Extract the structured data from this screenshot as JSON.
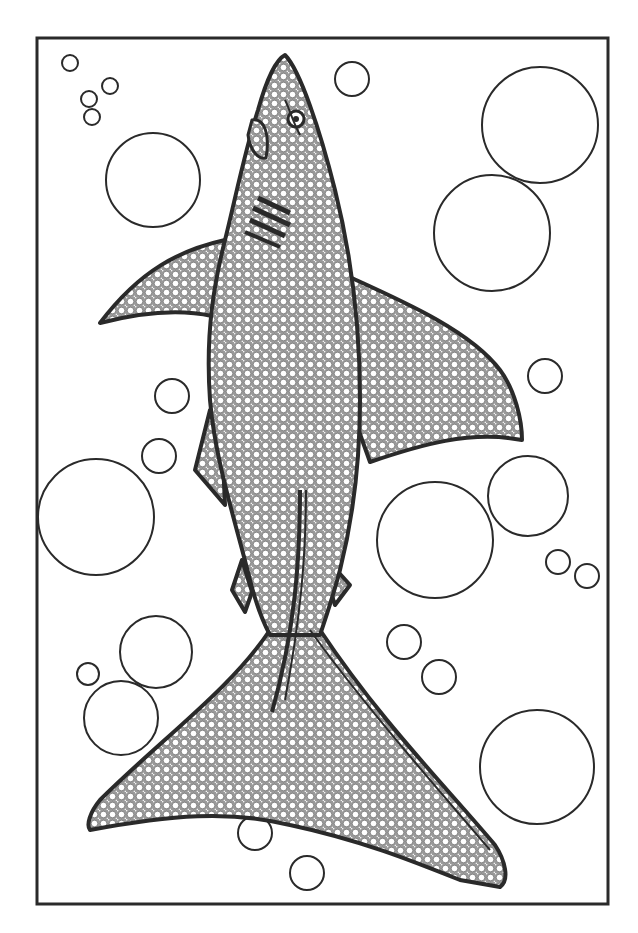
{
  "artwork": {
    "subject": "shark",
    "style": "coloring-page line art",
    "colors": {
      "ink": "#2a2a2a",
      "paper": "#ffffff",
      "texture": "#bdbdbd"
    },
    "frame": {
      "x": 37,
      "y": 38,
      "w": 571,
      "h": 866
    },
    "bubbles": [
      {
        "cx": 70,
        "cy": 63,
        "r": 8
      },
      {
        "cx": 110,
        "cy": 86,
        "r": 8
      },
      {
        "cx": 89,
        "cy": 99,
        "r": 8
      },
      {
        "cx": 92,
        "cy": 117,
        "r": 8
      },
      {
        "cx": 153,
        "cy": 180,
        "r": 47
      },
      {
        "cx": 352,
        "cy": 79,
        "r": 17
      },
      {
        "cx": 540,
        "cy": 125,
        "r": 58
      },
      {
        "cx": 492,
        "cy": 233,
        "r": 58
      },
      {
        "cx": 545,
        "cy": 376,
        "r": 17
      },
      {
        "cx": 172,
        "cy": 396,
        "r": 17
      },
      {
        "cx": 159,
        "cy": 456,
        "r": 17
      },
      {
        "cx": 96,
        "cy": 517,
        "r": 58
      },
      {
        "cx": 528,
        "cy": 496,
        "r": 40
      },
      {
        "cx": 435,
        "cy": 540,
        "r": 58
      },
      {
        "cx": 558,
        "cy": 562,
        "r": 12
      },
      {
        "cx": 587,
        "cy": 576,
        "r": 12
      },
      {
        "cx": 156,
        "cy": 652,
        "r": 36
      },
      {
        "cx": 88,
        "cy": 674,
        "r": 11
      },
      {
        "cx": 121,
        "cy": 718,
        "r": 37
      },
      {
        "cx": 404,
        "cy": 642,
        "r": 17
      },
      {
        "cx": 439,
        "cy": 677,
        "r": 17
      },
      {
        "cx": 537,
        "cy": 767,
        "r": 57
      },
      {
        "cx": 255,
        "cy": 833,
        "r": 17
      },
      {
        "cx": 307,
        "cy": 873,
        "r": 17
      }
    ]
  }
}
